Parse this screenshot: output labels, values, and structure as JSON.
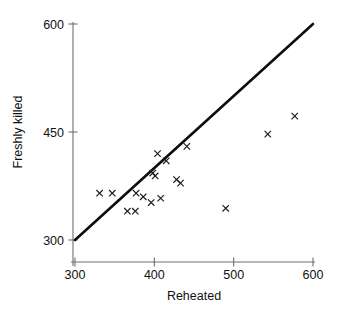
{
  "chart_data": {
    "type": "scatter",
    "title": "",
    "xlabel": "Reheated",
    "ylabel": "Freshly killed",
    "xlim": [
      300,
      600
    ],
    "ylim": [
      300,
      600
    ],
    "xticks": [
      300,
      400,
      500,
      600
    ],
    "yticks": [
      300,
      450,
      600
    ],
    "xtick_labels": [
      "300",
      "400",
      "500",
      "600"
    ],
    "ytick_labels": [
      "300",
      "450",
      "600"
    ],
    "grid": false,
    "legend": null,
    "marker": "x",
    "marker_color": "#1a1a1a",
    "series": [
      {
        "name": "observations",
        "points": [
          [
            331,
            365
          ],
          [
            347,
            365
          ],
          [
            366,
            340
          ],
          [
            376,
            340
          ],
          [
            377,
            365
          ],
          [
            386,
            360
          ],
          [
            396,
            352
          ],
          [
            398,
            393
          ],
          [
            401,
            389
          ],
          [
            404,
            420
          ],
          [
            408,
            358
          ],
          [
            415,
            410
          ],
          [
            428,
            384
          ],
          [
            433,
            379
          ],
          [
            441,
            430
          ],
          [
            490,
            344
          ],
          [
            543,
            447
          ],
          [
            577,
            472
          ]
        ]
      }
    ],
    "reference_line": {
      "name": "identity-line",
      "from": [
        300,
        300
      ],
      "to": [
        600,
        600
      ],
      "color": "#0d0d0d"
    }
  },
  "axes": {
    "x_title": "Reheated",
    "y_title": "Freshly killed"
  }
}
